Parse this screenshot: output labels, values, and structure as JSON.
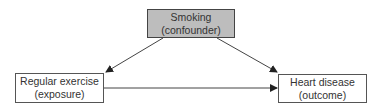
{
  "diagram": {
    "type": "causal-DAG",
    "nodes": {
      "confounder": {
        "line1": "Smoking",
        "line2": "(confounder)",
        "fill": "#bdbdbd"
      },
      "exposure": {
        "line1": "Regular exercise",
        "line2": "(exposure)",
        "fill": "#ffffff"
      },
      "outcome": {
        "line1": "Heart disease",
        "line2": "(outcome)",
        "fill": "#ffffff"
      }
    },
    "edges": [
      {
        "from": "confounder",
        "to": "exposure"
      },
      {
        "from": "confounder",
        "to": "outcome"
      },
      {
        "from": "exposure",
        "to": "outcome"
      }
    ]
  }
}
